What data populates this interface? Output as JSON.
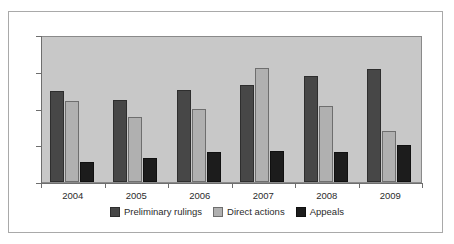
{
  "chart_data": {
    "type": "bar",
    "title": "",
    "subtitle": "",
    "xlabel": "",
    "ylabel": "",
    "categories": [
      "2004",
      "2005",
      "2006",
      "2007",
      "2008",
      "2009"
    ],
    "series": [
      {
        "name": "Preliminary rulings",
        "color": "#474747",
        "values": [
          249,
          222,
          250,
          265,
          288,
          308
        ]
      },
      {
        "name": "Direct actions",
        "color": "#b0b0b0",
        "values": [
          220,
          178,
          199,
          309,
          207,
          139
        ]
      },
      {
        "name": "Appeals",
        "color": "#1c1c1c",
        "values": [
          55,
          66,
          82,
          85,
          82,
          101
        ]
      }
    ],
    "ylim": [
      0,
      400
    ],
    "yticks": [
      0,
      100,
      200,
      300,
      400
    ],
    "ytick_labels": [
      "0",
      "100",
      "200",
      "300",
      "400"
    ],
    "grid": false,
    "legend_position": "bottom",
    "plot_background": "#c8c8c8",
    "figure_background": "#ffffff",
    "axis_color": "#6e6e6e"
  }
}
